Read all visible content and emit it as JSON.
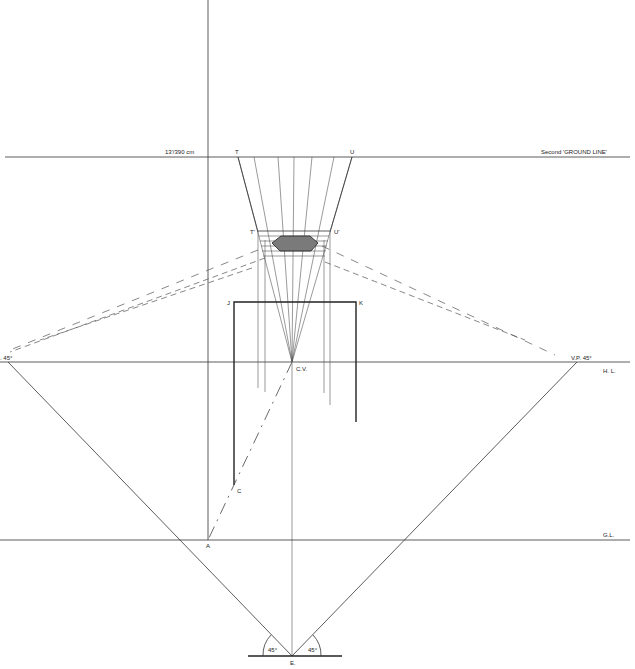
{
  "diagram": {
    "colors": {
      "line": "#333333",
      "shade": "#6e6e6e",
      "background": "#ffffff"
    },
    "labels": {
      "height_mark": "13'/390 cm",
      "second_ground_line": "Second 'GROUND LINE'",
      "T": "T",
      "U": "U",
      "T_prime": "T'",
      "U_prime": "U'",
      "J": "J",
      "K": "K",
      "cv": "C.V.",
      "vp_left": "V.P. 45°",
      "vp_left_visible": ". 45°",
      "vp_right": "V.P. 45°",
      "hl": "H. L.",
      "C": "C",
      "A": "A",
      "gl": "G.L.",
      "angle_left": "45°",
      "angle_right": "45°",
      "E": "E."
    }
  }
}
